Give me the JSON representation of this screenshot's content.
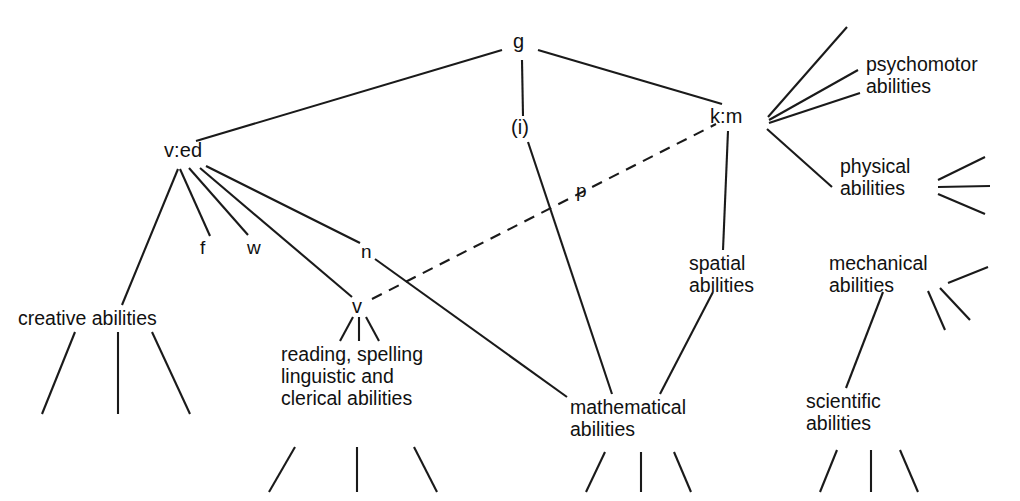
{
  "diagram": {
    "type": "hierarchical-tree",
    "title": "",
    "background_color": "#ffffff",
    "line_color": "#1a1a1a",
    "text_color": "#111111",
    "nodes": {
      "g": "g",
      "i": "(i)",
      "ved": "v:ed",
      "km": "k:m",
      "v": "v",
      "creative": "creative abilities",
      "reading_line1": "reading, spelling",
      "reading_line2": "linguistic and",
      "reading_line3": "clerical abilities",
      "mathematical_line1": "mathematical",
      "mathematical_line2": "abilities",
      "spatial_line1": "spatial",
      "spatial_line2": "abilities",
      "psychomotor_line1": "psychomotor",
      "psychomotor_line2": "abilities",
      "physical_line1": "physical",
      "physical_line2": "abilities",
      "mechanical_line1": "mechanical",
      "mechanical_line2": "abilities",
      "scientific_line1": "scientific",
      "scientific_line2": "abilities"
    },
    "edge_labels": {
      "f": "f",
      "w": "w",
      "n": "n",
      "p": "p"
    }
  }
}
